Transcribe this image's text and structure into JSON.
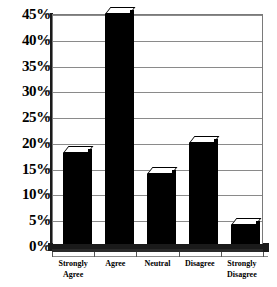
{
  "chart_data": {
    "type": "bar",
    "title": "",
    "subtitle": "",
    "xlabel": "",
    "ylabel": "",
    "categories": [
      "Strongly\nAgree",
      "Agree",
      "Neutral",
      "Disagree",
      "Strongly\nDisagree"
    ],
    "values": [
      18,
      45,
      14,
      20,
      4
    ],
    "ylim": [
      0,
      45
    ],
    "ytick_labels": [
      "45%",
      "40%",
      "35%",
      "30%",
      "25%",
      "20%",
      "15%",
      "10%",
      "5%",
      "0%"
    ],
    "ytick_values": [
      45,
      40,
      35,
      30,
      25,
      20,
      15,
      10,
      5,
      0
    ],
    "grid": true,
    "legend": false,
    "legend_position": "none",
    "series": [
      {
        "name": "Response share",
        "values": [
          18,
          45,
          14,
          20,
          4
        ]
      }
    ],
    "bar_color": "#000000",
    "grid_color": "#8a8a8a",
    "axis_color": "#1a1a1a",
    "background": "#ffffff"
  }
}
